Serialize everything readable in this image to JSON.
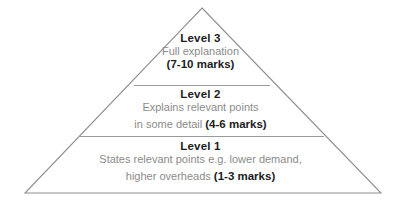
{
  "diagram": {
    "type": "pyramid",
    "title": "",
    "background_color": "#ffffff",
    "outline_color": "#909090",
    "divider_color": "#9a9a9a",
    "heading_color": "#1c1c1c",
    "body_color": "#8b8b8b",
    "tiers": [
      {
        "id": "level-3",
        "heading": "Level 3",
        "description_lines": [
          "Full explanation"
        ],
        "marks": "(7-10 marks)",
        "position": "top"
      },
      {
        "id": "level-2",
        "heading": "Level 2",
        "description_lines": [
          "Explains relevant points",
          "in some detail"
        ],
        "marks": "(4-6 marks)",
        "position": "middle"
      },
      {
        "id": "level-1",
        "heading": "Level 1",
        "description_lines": [
          "States relevant points e.g. lower demand,",
          "higher overheads"
        ],
        "marks": "(1-3 marks)",
        "position": "bottom"
      }
    ]
  }
}
